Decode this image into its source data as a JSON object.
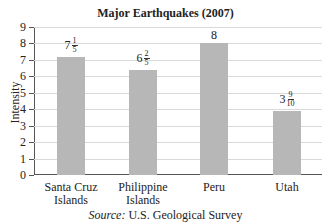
{
  "chart_data": {
    "type": "bar",
    "title": "Major Earthquakes (2007)",
    "xlabel": "",
    "ylabel": "Intensity",
    "ylim": [
      0,
      9
    ],
    "yticks": [
      0,
      1,
      2,
      3,
      4,
      5,
      6,
      7,
      8,
      9
    ],
    "grid": true,
    "categories": [
      "Santa Cruz Islands",
      "Philippine Islands",
      "Peru",
      "Utah"
    ],
    "category_lines": [
      [
        "Santa Cruz",
        "Islands"
      ],
      [
        "Philippine",
        "Islands"
      ],
      [
        "Peru"
      ],
      [
        "Utah"
      ]
    ],
    "values": [
      7.2,
      6.4,
      8,
      3.9
    ],
    "value_labels": [
      {
        "whole": "7",
        "num": "1",
        "den": "5"
      },
      {
        "whole": "6",
        "num": "2",
        "den": "5"
      },
      {
        "whole": "8",
        "num": "",
        "den": ""
      },
      {
        "whole": "3",
        "num": "9",
        "den": "10"
      }
    ],
    "bar_color": "#b7b7b7",
    "source_prefix": "Source:",
    "source_text": " U.S. Geological Survey"
  }
}
